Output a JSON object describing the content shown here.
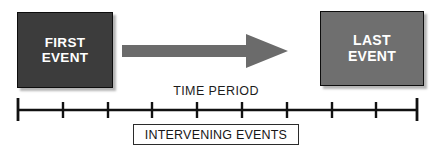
{
  "diagram": {
    "width": 437,
    "height": 152,
    "background_color": "#ffffff"
  },
  "first_event": {
    "line1": "FIRST",
    "line2": "EVENT",
    "fill_color": "#3c3c3c",
    "text_color": "#ffffff",
    "border_color": "#0d0d0d"
  },
  "last_event": {
    "line1": "LAST",
    "line2": "EVENT",
    "fill_color": "#6f6f6f",
    "text_color": "#ffffff",
    "border_color": "#0d0d0d"
  },
  "arrow": {
    "name": "rightward-arrow",
    "color": "#6b6b6b",
    "direction": "right"
  },
  "time_period": {
    "label": "TIME PERIOD",
    "text_color": "#1c1c1c"
  },
  "intervening_events": {
    "label": "INTERVENING EVENTS",
    "text_color": "#161616",
    "border_color": "#2b2b2b",
    "fill_color": "#ffffff"
  },
  "timeline": {
    "axis_color": "#111111",
    "tick_count": 10,
    "tick_positions": [
      8,
      53,
      98,
      142,
      187,
      232,
      277,
      322,
      366,
      407
    ],
    "endpoint_ticks": [
      8,
      407
    ],
    "axis_start": 8,
    "axis_end": 407,
    "axis_y": 14
  }
}
